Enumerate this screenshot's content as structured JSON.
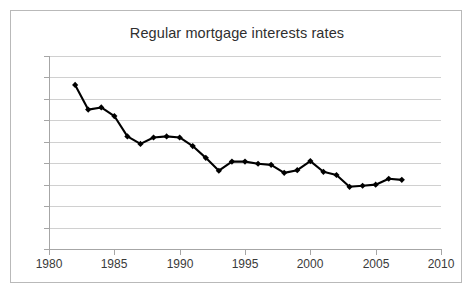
{
  "chart_data": {
    "type": "line",
    "title": "Regular mortgage interests rates",
    "xlabel": "",
    "ylabel": "",
    "xlim": [
      1980,
      2010
    ],
    "ylim": [
      0,
      18
    ],
    "xticks": [
      1980,
      1985,
      1990,
      1995,
      2000,
      2005,
      2010
    ],
    "yticks": [
      0,
      2,
      4,
      6,
      8,
      10,
      12,
      14,
      16,
      18
    ],
    "grid": true,
    "legend": false,
    "marker": "diamond",
    "series_color": "#000000",
    "grid_color": "#d0d0d0",
    "x": [
      1982,
      1983,
      1984,
      1985,
      1986,
      1987,
      1988,
      1989,
      1990,
      1991,
      1992,
      1993,
      1994,
      1995,
      1996,
      1997,
      1998,
      1999,
      2000,
      2001,
      2002,
      2003,
      2004,
      2005,
      2006,
      2007
    ],
    "values": [
      15.3,
      13.0,
      13.2,
      12.4,
      10.5,
      9.8,
      10.4,
      10.5,
      10.4,
      9.6,
      8.5,
      7.3,
      8.15,
      8.15,
      7.95,
      7.85,
      7.1,
      7.35,
      8.2,
      7.2,
      6.9,
      5.8,
      5.9,
      6.0,
      6.55,
      6.45
    ]
  }
}
